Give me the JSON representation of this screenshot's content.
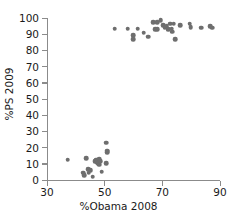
{
  "chart_data": {
    "type": "scatter",
    "title": "",
    "xlabel": "%Obama 2008",
    "ylabel": "%PS 2009",
    "xlim": [
      30,
      90
    ],
    "ylim": [
      0,
      100
    ],
    "xticks": [
      30,
      50,
      70,
      90
    ],
    "yticks": [
      0,
      10,
      20,
      30,
      40,
      50,
      60,
      70,
      80,
      90,
      100
    ],
    "grid": false,
    "legend": "none",
    "marker_color": "#6e6e6e",
    "axis_color": "#8b8b8b",
    "series": [
      {
        "name": "districts",
        "points": [
          [
            53.5,
            93.5
          ],
          [
            58.0,
            93.5
          ],
          [
            59.8,
            89.5
          ],
          [
            59.8,
            87.0
          ],
          [
            61.5,
            93.5
          ],
          [
            63.5,
            91.0
          ],
          [
            65.0,
            88.5
          ],
          [
            66.8,
            97.5
          ],
          [
            67.5,
            93.0
          ],
          [
            68.2,
            97.5
          ],
          [
            68.2,
            93.0
          ],
          [
            69.5,
            98.5
          ],
          [
            70.2,
            95.5
          ],
          [
            70.8,
            94.0
          ],
          [
            71.5,
            95.0
          ],
          [
            72.0,
            93.0
          ],
          [
            72.8,
            96.5
          ],
          [
            73.2,
            93.5
          ],
          [
            73.5,
            91.5
          ],
          [
            74.0,
            96.5
          ],
          [
            74.5,
            87.0
          ],
          [
            76.2,
            95.5
          ],
          [
            79.5,
            96.5
          ],
          [
            79.8,
            94.5
          ],
          [
            83.5,
            94.0
          ],
          [
            86.5,
            95.0
          ],
          [
            87.2,
            94.0
          ],
          [
            37.2,
            12.5
          ],
          [
            42.5,
            4.5
          ],
          [
            42.8,
            3.0
          ],
          [
            43.5,
            13.5
          ],
          [
            44.2,
            6.5
          ],
          [
            44.5,
            4.5
          ],
          [
            45.2,
            6.0
          ],
          [
            45.8,
            2.0
          ],
          [
            46.5,
            11.5
          ],
          [
            47.0,
            12.5
          ],
          [
            47.5,
            11.0
          ],
          [
            47.8,
            10.5
          ],
          [
            48.2,
            13.0
          ],
          [
            48.2,
            9.5
          ],
          [
            48.5,
            11.5
          ],
          [
            49.0,
            5.0
          ],
          [
            50.5,
            23.0
          ],
          [
            50.8,
            18.0
          ],
          [
            50.8,
            17.0
          ],
          [
            50.5,
            10.5
          ]
        ]
      }
    ]
  }
}
